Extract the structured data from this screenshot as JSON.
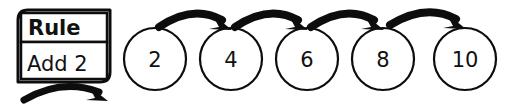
{
  "diagram": {
    "type": "function-machine-number-pattern",
    "rule_card": {
      "title_label": "Rule",
      "operation_label": "Add 2",
      "output_arrow_icon": "curved-arrow-right-icon"
    },
    "sequence": {
      "step_increment": 2,
      "nodes": [
        {
          "label": "2"
        },
        {
          "label": "4"
        },
        {
          "label": "6"
        },
        {
          "label": "8"
        },
        {
          "label": "10"
        }
      ],
      "connector_icon": "curved-arrow-right-icon",
      "connector_count": 4
    },
    "colors": {
      "ink": "#0d0d0d",
      "text": "#111111",
      "paper": "#ffffff"
    }
  }
}
